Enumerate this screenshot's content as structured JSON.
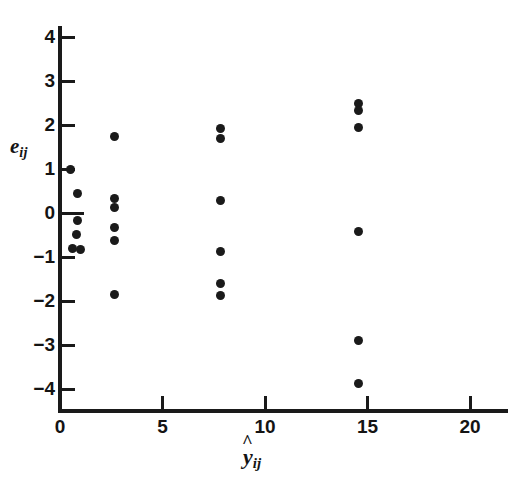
{
  "chart_data": {
    "type": "scatter",
    "title": "",
    "xlabel": "ŷ_ij",
    "ylabel": "e_ij",
    "xlabel_base": "y",
    "xlabel_sub": "ij",
    "ylabel_base": "e",
    "ylabel_sub": "ij",
    "xlim": [
      0,
      22
    ],
    "ylim": [
      -4.6,
      4.4
    ],
    "grid": false,
    "legend": "none",
    "xticks": [
      0,
      5,
      10,
      15,
      20
    ],
    "xtick_labels": [
      "0",
      "5",
      "10",
      "15",
      "20"
    ],
    "yticks": [
      4,
      3,
      2,
      1,
      0,
      -1,
      -2,
      -3,
      -4
    ],
    "ytick_labels": [
      "4",
      "3",
      "2",
      "1",
      "0",
      "−1",
      "−2",
      "−3",
      "−4"
    ],
    "marker": "filled-circle",
    "marker_color": "#1a1a1a",
    "points": [
      {
        "x": 0.5,
        "y": 0.98
      },
      {
        "x": 0.85,
        "y": 0.45
      },
      {
        "x": 0.85,
        "y": -0.18
      },
      {
        "x": 0.8,
        "y": -0.48
      },
      {
        "x": 0.6,
        "y": -0.8
      },
      {
        "x": 1.0,
        "y": -0.82
      },
      {
        "x": 2.65,
        "y": 1.73
      },
      {
        "x": 2.65,
        "y": 0.33
      },
      {
        "x": 2.65,
        "y": 0.12
      },
      {
        "x": 2.65,
        "y": -0.33
      },
      {
        "x": 2.65,
        "y": -0.62
      },
      {
        "x": 2.65,
        "y": -1.85
      },
      {
        "x": 7.85,
        "y": 1.92
      },
      {
        "x": 7.85,
        "y": 1.7
      },
      {
        "x": 7.85,
        "y": 0.28
      },
      {
        "x": 7.85,
        "y": -0.88
      },
      {
        "x": 7.85,
        "y": -1.6
      },
      {
        "x": 7.85,
        "y": -1.88
      },
      {
        "x": 14.55,
        "y": 2.5
      },
      {
        "x": 14.55,
        "y": 2.33
      },
      {
        "x": 14.55,
        "y": 1.95
      },
      {
        "x": 14.55,
        "y": -0.42
      },
      {
        "x": 14.55,
        "y": -2.9
      },
      {
        "x": 14.55,
        "y": -3.87
      }
    ]
  },
  "figure": {
    "background": "#ffffff",
    "axis_color": "#1a1a1a"
  }
}
